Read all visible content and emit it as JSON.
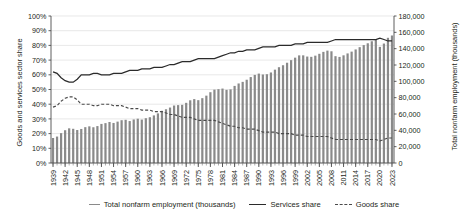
{
  "chart_data": {
    "type": "bar",
    "title": "",
    "xlabel": "",
    "ylabel": "Goods and services sector share",
    "y2label": "Total nonfarm employment (thousands)",
    "ylim": [
      0,
      1.0
    ],
    "y2lim": [
      0,
      180000
    ],
    "grid": true,
    "legend_position": "bottom",
    "y_ticks": [
      "0%",
      "10%",
      "20%",
      "30%",
      "40%",
      "50%",
      "60%",
      "70%",
      "80%",
      "90%",
      "100%"
    ],
    "y2_ticks": [
      "0",
      "20,000",
      "40,000",
      "60,000",
      "80,000",
      "100,000",
      "120,000",
      "140,000",
      "160,000",
      "180,000"
    ],
    "x_tick_labels": [
      "1939",
      "1942",
      "1945",
      "1948",
      "1951",
      "1954",
      "1957",
      "1960",
      "1963",
      "1966",
      "1969",
      "1972",
      "1975",
      "1978",
      "1981",
      "1984",
      "1987",
      "1990",
      "1993",
      "1996",
      "1999",
      "2002",
      "2005",
      "2008",
      "2011",
      "2014",
      "2017",
      "2020",
      "2023"
    ],
    "x": [
      1939,
      1940,
      1941,
      1942,
      1943,
      1944,
      1945,
      1946,
      1947,
      1948,
      1949,
      1950,
      1951,
      1952,
      1953,
      1954,
      1955,
      1956,
      1957,
      1958,
      1959,
      1960,
      1961,
      1962,
      1963,
      1964,
      1965,
      1966,
      1967,
      1968,
      1969,
      1970,
      1971,
      1972,
      1973,
      1974,
      1975,
      1976,
      1977,
      1978,
      1979,
      1980,
      1981,
      1982,
      1983,
      1984,
      1985,
      1986,
      1987,
      1988,
      1989,
      1990,
      1991,
      1992,
      1993,
      1994,
      1995,
      1996,
      1997,
      1998,
      1999,
      2000,
      2001,
      2002,
      2003,
      2004,
      2005,
      2006,
      2007,
      2008,
      2009,
      2010,
      2011,
      2012,
      2013,
      2014,
      2015,
      2016,
      2017,
      2018,
      2019,
      2020,
      2021,
      2022,
      2023
    ],
    "series": [
      {
        "name": "Total nonfarm employment (thousands)",
        "type": "bar",
        "axis": "right",
        "color": "#8a8a8a",
        "values": [
          30618,
          32376,
          36554,
          40125,
          42452,
          41883,
          40394,
          41674,
          43881,
          44891,
          43778,
          45222,
          47849,
          48825,
          50204,
          49022,
          50675,
          52408,
          52894,
          51363,
          53313,
          54234,
          53153,
          54843,
          56058,
          58283,
          60765,
          63901,
          65803,
          67897,
          70384,
          70880,
          71214,
          73675,
          76790,
          78265,
          76945,
          79382,
          82471,
          86697,
          89823,
          90406,
          91152,
          89544,
          90152,
          94408,
          97387,
          99344,
          101958,
          105210,
          107895,
          109487,
          108374,
          108726,
          110844,
          114291,
          117298,
          119708,
          122776,
          125930,
          128993,
          131785,
          131826,
          130341,
          129999,
          131435,
          133703,
          136086,
          137598,
          136790,
          130807,
          129899,
          131843,
          134175,
          136381,
          139042,
          141833,
          144349,
          146615,
          149079,
          150904,
          142186,
          146269,
          153306,
          156132
        ]
      },
      {
        "name": "Services share",
        "type": "line",
        "axis": "left",
        "style": "solid",
        "color": "#2b2b2b",
        "values": [
          0.62,
          0.61,
          0.58,
          0.56,
          0.55,
          0.55,
          0.57,
          0.6,
          0.6,
          0.6,
          0.61,
          0.61,
          0.6,
          0.6,
          0.6,
          0.61,
          0.61,
          0.61,
          0.62,
          0.63,
          0.63,
          0.63,
          0.64,
          0.64,
          0.64,
          0.65,
          0.65,
          0.65,
          0.66,
          0.67,
          0.67,
          0.68,
          0.69,
          0.69,
          0.69,
          0.7,
          0.71,
          0.71,
          0.71,
          0.71,
          0.71,
          0.72,
          0.73,
          0.74,
          0.75,
          0.75,
          0.76,
          0.76,
          0.77,
          0.77,
          0.77,
          0.78,
          0.79,
          0.79,
          0.79,
          0.79,
          0.8,
          0.8,
          0.8,
          0.8,
          0.81,
          0.81,
          0.81,
          0.82,
          0.82,
          0.82,
          0.82,
          0.82,
          0.82,
          0.83,
          0.84,
          0.84,
          0.84,
          0.84,
          0.84,
          0.84,
          0.84,
          0.84,
          0.84,
          0.84,
          0.84,
          0.85,
          0.84,
          0.83,
          0.83
        ]
      },
      {
        "name": "Goods share",
        "type": "line",
        "axis": "left",
        "style": "dashed",
        "color": "#4a4a4a",
        "values": [
          0.38,
          0.39,
          0.42,
          0.44,
          0.45,
          0.45,
          0.43,
          0.4,
          0.4,
          0.4,
          0.39,
          0.39,
          0.4,
          0.4,
          0.4,
          0.39,
          0.39,
          0.39,
          0.38,
          0.37,
          0.37,
          0.37,
          0.36,
          0.36,
          0.36,
          0.35,
          0.35,
          0.35,
          0.34,
          0.33,
          0.33,
          0.32,
          0.31,
          0.31,
          0.31,
          0.3,
          0.29,
          0.29,
          0.29,
          0.29,
          0.29,
          0.28,
          0.27,
          0.26,
          0.25,
          0.25,
          0.24,
          0.24,
          0.23,
          0.23,
          0.23,
          0.22,
          0.21,
          0.21,
          0.21,
          0.21,
          0.2,
          0.2,
          0.2,
          0.2,
          0.19,
          0.19,
          0.19,
          0.18,
          0.18,
          0.18,
          0.18,
          0.18,
          0.18,
          0.17,
          0.16,
          0.16,
          0.16,
          0.16,
          0.16,
          0.16,
          0.16,
          0.16,
          0.16,
          0.16,
          0.16,
          0.15,
          0.16,
          0.17,
          0.17
        ]
      }
    ]
  },
  "axes": {
    "left_title": "Goods and services sector share",
    "right_title": "Total nonfarm employment (thousands)"
  },
  "legend": {
    "items": [
      {
        "label": "Total nonfarm employment (thousands)",
        "marker": "bar-swatch"
      },
      {
        "label": "Services share",
        "marker": "solid-line-swatch"
      },
      {
        "label": "Goods share",
        "marker": "dashed-line-swatch"
      }
    ]
  }
}
